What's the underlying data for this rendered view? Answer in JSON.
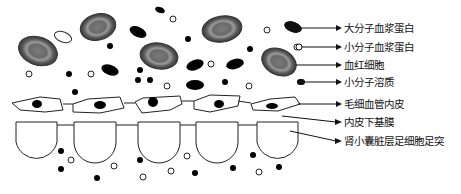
{
  "labels": {
    "large_plasma_protein": "大分子血浆蛋白",
    "small_plasma_protein": "小分子血浆蛋白",
    "red_blood_cell": "血红细胞",
    "small_solute": "小分子溶质",
    "capillary_endothelium": "毛细血管内皮",
    "basement_membrane": "内皮下基膜",
    "podocyte_foot_process": "肾小囊脏层足细胞足突"
  },
  "colors": {
    "rbc_outer": "#6b6b6b",
    "rbc_inner": "#8a8a8a",
    "black": "#000000",
    "line": "#222222"
  }
}
